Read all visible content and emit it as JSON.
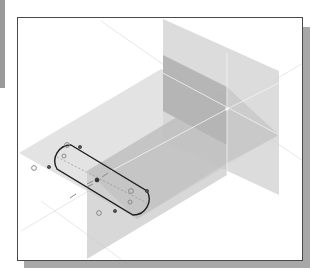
{
  "viewport": {
    "type": "cad-3d-sketch-view",
    "origin": {
      "x": 226,
      "y": 108
    },
    "colors": {
      "frame": "#4a4a4a",
      "shadow": "#a8a8a8",
      "plane_light": "#e4e4e4",
      "plane_mid": "#cfcfcf",
      "plane_dark": "#b3b3b3",
      "sketch_line": "#1e1e1e",
      "axis_line": "#f2f2f2"
    },
    "planes": [
      "top-plane",
      "front-plane",
      "right-plane"
    ],
    "sketch": {
      "shape": "slot",
      "constraint_glyphs": 6,
      "endpoint_markers": 4
    }
  }
}
